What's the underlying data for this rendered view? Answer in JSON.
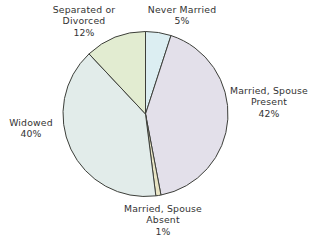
{
  "chart_data": {
    "type": "pie",
    "title": "",
    "subtitle": "",
    "xlabel": "",
    "ylabel": "",
    "legend_position": "none",
    "grid": false,
    "units": "percent",
    "start_angle_deg": 0,
    "direction": "clockwise",
    "categories": [
      "Never Married",
      "Married, Spouse Present",
      "Married, Spouse Absent",
      "Widowed",
      "Separated or Divorced"
    ],
    "values": [
      5,
      42,
      1,
      40,
      12
    ],
    "value_labels": [
      "5%",
      "42%",
      "1%",
      "40%",
      "12%"
    ],
    "colors": [
      "#dceef2",
      "#e3e0ea",
      "#e8e4c4",
      "#e2ecea",
      "#e2ecd1"
    ],
    "stroke_color": "#3d3f3a",
    "slices": [
      {
        "name": "Never Married",
        "label_line1": "Never Married",
        "label_line2": "",
        "value": 5,
        "value_label": "5%",
        "color": "#dceef2"
      },
      {
        "name": "Married, Spouse Present",
        "label_line1": "Married, Spouse",
        "label_line2": "Present",
        "value": 42,
        "value_label": "42%",
        "color": "#e3e0ea"
      },
      {
        "name": "Married, Spouse Absent",
        "label_line1": "Married, Spouse",
        "label_line2": "Absent",
        "value": 1,
        "value_label": "1%",
        "color": "#e8e4c4"
      },
      {
        "name": "Widowed",
        "label_line1": "Widowed",
        "label_line2": "",
        "value": 40,
        "value_label": "40%",
        "color": "#e2ecea"
      },
      {
        "name": "Separated or Divorced",
        "label_line1": "Separated or",
        "label_line2": "Divorced",
        "value": 12,
        "value_label": "12%",
        "color": "#e2ecd1"
      }
    ]
  },
  "labels": {
    "never_married": {
      "line1": "Never Married",
      "line2": "",
      "pct": "5%"
    },
    "separated_divorced": {
      "line1": "Separated or",
      "line2": "Divorced",
      "pct": "12%"
    },
    "married_present": {
      "line1": "Married, Spouse",
      "line2": "Present",
      "pct": "42%"
    },
    "widowed": {
      "line1": "Widowed",
      "line2": "",
      "pct": "40%"
    },
    "married_absent": {
      "line1": "Married, Spouse",
      "line2": "Absent",
      "pct": "1%"
    }
  }
}
